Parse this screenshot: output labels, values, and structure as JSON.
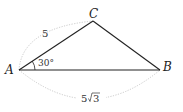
{
  "diagram": {
    "type": "triangle",
    "vertices": {
      "A": {
        "label": "A",
        "x": 19,
        "y": 70
      },
      "B": {
        "label": "B",
        "x": 160,
        "y": 70
      },
      "C": {
        "label": "C",
        "x": 93,
        "y": 21
      }
    },
    "angle_A": "30°",
    "side_AC": "5",
    "side_AB_coef": "5",
    "side_AB_radicand": "3",
    "colors": {
      "edge": "#222222",
      "arc": "#bbbbbb"
    }
  }
}
